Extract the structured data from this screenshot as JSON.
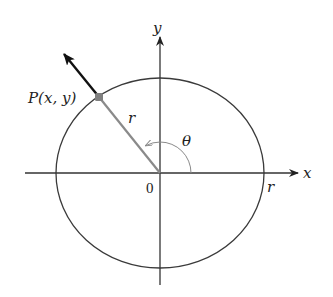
{
  "diagram": {
    "type": "unit-circle-angle",
    "labels": {
      "x_axis": "x",
      "y_axis": "y",
      "origin": "0",
      "point": "P(x, y)",
      "radius_on_segment": "r",
      "radius_on_axis": "r",
      "angle": "θ"
    },
    "colors": {
      "axes": "#333333",
      "circle": "#3a3a3a",
      "radius_segment": "#8a8a8a",
      "point": "#808080",
      "vector": "#111111",
      "angle_arc": "#8a8a8a"
    }
  }
}
